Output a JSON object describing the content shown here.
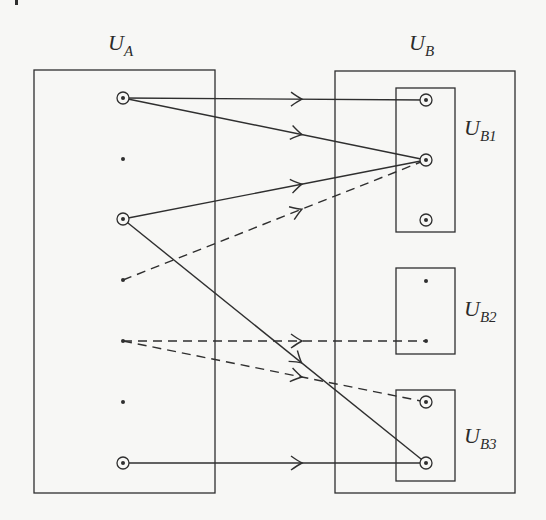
{
  "diagram": {
    "title": "",
    "colors": {
      "stroke": "#2f2f2f",
      "background": "#f7f7f5"
    },
    "labels": {
      "UA": {
        "main": "U",
        "sub": "A"
      },
      "UB": {
        "main": "U",
        "sub": "B"
      },
      "UB1": {
        "main": "U",
        "sub": "B1"
      },
      "UB2": {
        "main": "U",
        "sub": "B2"
      },
      "UB3": {
        "main": "U",
        "sub": "B3"
      }
    },
    "sets": [
      {
        "id": "UA",
        "x": 34,
        "y": 70,
        "w": 181,
        "h": 423
      },
      {
        "id": "UB",
        "x": 335,
        "y": 71,
        "w": 180,
        "h": 422
      },
      {
        "id": "UB1",
        "x": 396,
        "y": 88,
        "w": 59,
        "h": 144
      },
      {
        "id": "UB2",
        "x": 396,
        "y": 268,
        "w": 59,
        "h": 86
      },
      {
        "id": "UB3",
        "x": 396,
        "y": 390,
        "w": 59,
        "h": 91
      }
    ],
    "nodes": [
      {
        "id": "a1",
        "set": "UA",
        "x": 123,
        "y": 98,
        "type": "circled"
      },
      {
        "id": "a2",
        "set": "UA",
        "x": 123,
        "y": 159,
        "type": "dot"
      },
      {
        "id": "a3",
        "set": "UA",
        "x": 123,
        "y": 219,
        "type": "circled"
      },
      {
        "id": "a4",
        "set": "UA",
        "x": 123,
        "y": 280,
        "type": "dot"
      },
      {
        "id": "a5",
        "set": "UA",
        "x": 123,
        "y": 341,
        "type": "dot"
      },
      {
        "id": "a6",
        "set": "UA",
        "x": 123,
        "y": 402,
        "type": "dot"
      },
      {
        "id": "a7",
        "set": "UA",
        "x": 123,
        "y": 463,
        "type": "circled"
      },
      {
        "id": "b1",
        "set": "UB1",
        "x": 426,
        "y": 100,
        "type": "circled"
      },
      {
        "id": "b2",
        "set": "UB1",
        "x": 426,
        "y": 160,
        "type": "circled"
      },
      {
        "id": "b3",
        "set": "UB1",
        "x": 426,
        "y": 220,
        "type": "circled"
      },
      {
        "id": "b4",
        "set": "UB2",
        "x": 426,
        "y": 281,
        "type": "dot"
      },
      {
        "id": "b5",
        "set": "UB2",
        "x": 426,
        "y": 341,
        "type": "dot"
      },
      {
        "id": "b6",
        "set": "UB3",
        "x": 426,
        "y": 402,
        "type": "circled"
      },
      {
        "id": "b7",
        "set": "UB3",
        "x": 426,
        "y": 463,
        "type": "circled"
      }
    ],
    "edges": [
      {
        "from": "a1",
        "to": "b1",
        "style": "solid"
      },
      {
        "from": "a1",
        "to": "b2",
        "style": "solid"
      },
      {
        "from": "a3",
        "to": "b2",
        "style": "solid"
      },
      {
        "from": "a4",
        "to": "b2",
        "style": "dashed"
      },
      {
        "from": "a3",
        "to": "b7",
        "style": "solid"
      },
      {
        "from": "a5",
        "to": "b5",
        "style": "dashed"
      },
      {
        "from": "a5",
        "to": "b6",
        "style": "dashed"
      },
      {
        "from": "a7",
        "to": "b7",
        "style": "solid"
      }
    ]
  }
}
